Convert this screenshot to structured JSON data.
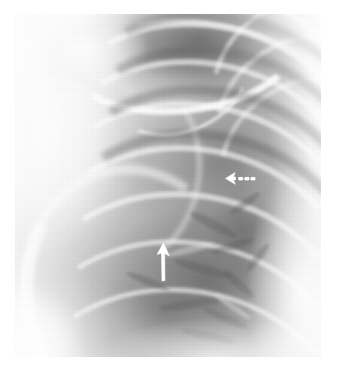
{
  "image": {
    "kind": "chest-radiograph",
    "modality_label": "X-ray",
    "view_description": "Coned-down frontal chest radiograph, right upper and mid zone",
    "background_color": "#ffffff",
    "plate": {
      "left": 15,
      "top": 14,
      "width": 306,
      "height": 343,
      "border_color": "#ffffff",
      "tone_light": "#ffffff",
      "tone_mid": "#aaaaaa",
      "tone_dark": "#525252"
    }
  },
  "annotations": [
    {
      "id": "arrow-up",
      "name": "solid-up-arrow",
      "style": "solid",
      "direction": "up",
      "color": "#ffffff",
      "x": 136,
      "y": 224,
      "width": 26,
      "height": 48,
      "tip_x": 148,
      "tip_y": 229,
      "description": "Solid white arrow pointing up in the mid lung field"
    },
    {
      "id": "arrow-dash",
      "name": "dashed-left-arrow",
      "style": "dashed",
      "direction": "left",
      "color": "#ffffff",
      "x": 206,
      "y": 155,
      "width": 38,
      "height": 20,
      "tip_x": 211,
      "tip_y": 164,
      "dash_count": 3,
      "description": "Dashed white arrow pointing left in the upper lung field"
    }
  ],
  "anatomy_labels": {
    "upper_left": "shoulder and humeral head",
    "upper_center": "clavicle crossing lung apex",
    "upper_right": "posterior ribs and intercostal spaces",
    "left_column": "soft tissue of lateral chest wall",
    "lower_center": "lower lung field with vascular markings",
    "right_border": "mediastinal border"
  }
}
